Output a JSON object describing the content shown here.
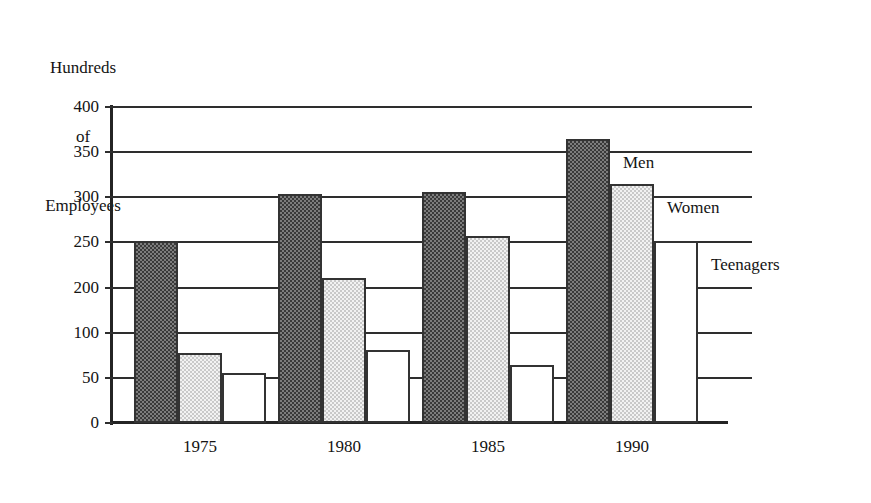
{
  "chart_data": {
    "type": "bar",
    "title": "",
    "subtitle": "",
    "ylabel_lines": [
      "Hundreds",
      "of",
      "Employees"
    ],
    "ylabel": "Hundreds of Employees",
    "xlabel": "",
    "categories": [
      "1975",
      "1980",
      "1985",
      "1990"
    ],
    "series": [
      {
        "name": "Men",
        "fill": "dark-dither",
        "values": [
          230,
          290,
          292,
          360
        ]
      },
      {
        "name": "Women",
        "fill": "light-dither",
        "values": [
          88,
          183,
          237,
          302
        ]
      },
      {
        "name": "Teenagers",
        "fill": "white",
        "values": [
          63,
          92,
          73,
          231
        ]
      }
    ],
    "ylim": [
      0,
      400
    ],
    "ytick_labels": [
      "400",
      "350",
      "300",
      "250",
      "200",
      "100",
      "50",
      "0"
    ],
    "ytick_values": [
      400,
      350,
      300,
      250,
      200,
      150,
      50,
      0
    ],
    "gridline_count": 8,
    "grid": true,
    "legend_position": "inline-right-of-last-group",
    "legend_entries": [
      "Men",
      "Women",
      "Teenagers"
    ],
    "note": "Y axis tick between 200 and 50 is printed as 100 although gridlines are evenly spaced"
  },
  "colors": {
    "axis": "#242424",
    "gridline": "#2e2e2e",
    "bar_outline": "#333333",
    "men_fill": "#7d7d7d",
    "women_fill": "#f2f2f2",
    "teenagers_fill": "#ffffff",
    "text": "#141414",
    "background": "#ffffff"
  }
}
